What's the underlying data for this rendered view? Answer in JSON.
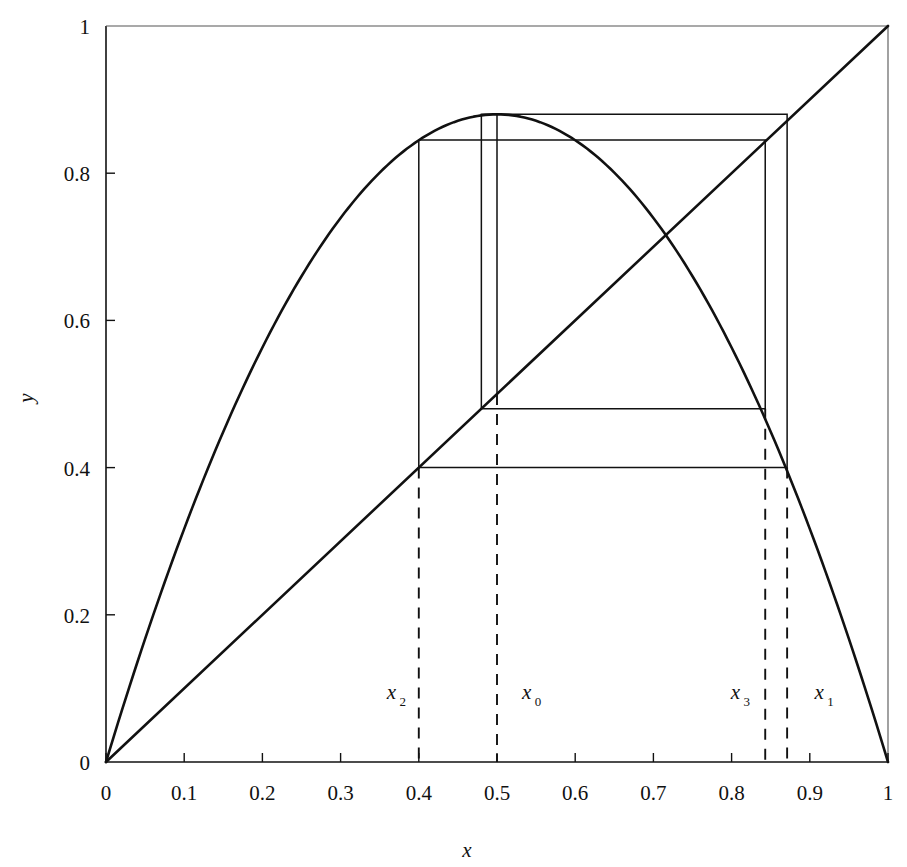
{
  "figure": {
    "xlabel": "x",
    "ylabel": "y"
  },
  "axes": {
    "x_ticks": [
      "0",
      "0.1",
      "0.2",
      "0.3",
      "0.4",
      "0.5",
      "0.6",
      "0.7",
      "0.8",
      "0.9",
      "1"
    ],
    "x_tick_values": [
      0,
      0.1,
      0.2,
      0.3,
      0.4,
      0.5,
      0.6,
      0.7,
      0.8,
      0.9,
      1
    ],
    "y_ticks": [
      "0",
      "0.2",
      "0.4",
      "0.6",
      "0.8",
      "1"
    ],
    "y_tick_values": [
      0,
      0.2,
      0.4,
      0.6,
      0.8,
      1
    ]
  },
  "annotations": [
    {
      "id": "x2",
      "base": "x",
      "sub": "2",
      "x": 0.4,
      "label_x": 0.365,
      "label_y": 0.085
    },
    {
      "id": "x0",
      "base": "x",
      "sub": "0",
      "x": 0.5,
      "label_x": 0.538,
      "label_y": 0.085
    },
    {
      "id": "x3",
      "base": "x",
      "sub": "3",
      "x": 0.843,
      "label_x": 0.805,
      "label_y": 0.085
    },
    {
      "id": "x1",
      "base": "x",
      "sub": "1",
      "x": 0.871,
      "label_x": 0.912,
      "label_y": 0.085
    }
  ],
  "chart_data": {
    "type": "line",
    "title": "",
    "xlabel": "x",
    "ylabel": "y",
    "xlim": [
      0,
      1
    ],
    "ylim": [
      0,
      1
    ],
    "grid": false,
    "legend": "none",
    "series": [
      {
        "name": "logistic-map",
        "kind": "parabola",
        "equation": "y = r*x*(1-x)",
        "r": 3.52,
        "peak": {
          "x": 0.5,
          "y": 0.88
        },
        "points_x": [
          0.0,
          0.05,
          0.1,
          0.15,
          0.2,
          0.25,
          0.3,
          0.35,
          0.4,
          0.45,
          0.5,
          0.55,
          0.6,
          0.65,
          0.7,
          0.75,
          0.8,
          0.85,
          0.9,
          0.95,
          1.0
        ],
        "points_y": [
          0.0,
          0.167,
          0.317,
          0.449,
          0.563,
          0.66,
          0.739,
          0.801,
          0.845,
          0.871,
          0.88,
          0.871,
          0.845,
          0.801,
          0.739,
          0.66,
          0.563,
          0.449,
          0.317,
          0.167,
          0.0
        ]
      },
      {
        "name": "identity-line",
        "kind": "line",
        "equation": "y = x",
        "points_x": [
          0,
          1
        ],
        "points_y": [
          0,
          1
        ]
      },
      {
        "name": "cobweb-path",
        "kind": "cobweb",
        "seed": 0.5,
        "orbit": [
          0.5,
          0.88,
          0.4,
          0.845,
          0.48,
          0.871
        ],
        "vertices_x": [
          0.5,
          0.5,
          0.871,
          0.871,
          0.4,
          0.4,
          0.843,
          0.843,
          0.48,
          0.48,
          0.871
        ],
        "vertices_y": [
          0.5,
          0.88,
          0.88,
          0.4,
          0.4,
          0.845,
          0.845,
          0.48,
          0.48,
          0.88,
          0.88
        ]
      }
    ],
    "markers": {
      "x0": 0.5,
      "x1": 0.871,
      "x2": 0.4,
      "x3": 0.843,
      "horizontal_levels": [
        0.88,
        0.845,
        0.48,
        0.4
      ]
    }
  }
}
